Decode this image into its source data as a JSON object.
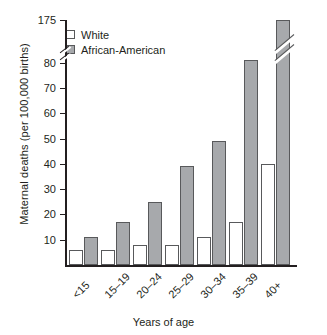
{
  "chart_data": {
    "type": "bar",
    "title": "",
    "xlabel": "Years of age",
    "ylabel": "Maternal deaths (per 100,000 births)",
    "categories": [
      "<15",
      "15–19",
      "20–24",
      "25–29",
      "30–34",
      "35–39",
      "40+"
    ],
    "series": [
      {
        "name": "White",
        "color": "#ffffff",
        "values": [
          6,
          6,
          8,
          8,
          11,
          17,
          40
        ]
      },
      {
        "name": "African-American",
        "color": "#a7a9ac",
        "values": [
          11,
          17,
          25,
          39,
          49,
          81,
          175
        ]
      }
    ],
    "ylim": [
      0,
      90
    ],
    "yticks": [
      10,
      20,
      30,
      40,
      50,
      60,
      70,
      80
    ],
    "ytick_labels": [
      "10",
      "20",
      "30",
      "40",
      "50",
      "60",
      "70",
      "80"
    ],
    "axis_break": {
      "present": true,
      "label_above_break": "175",
      "note": "y axis is broken between 80 and 175; the 40+ African-American bar (175) is drawn clipped with a break mark"
    },
    "grid": false,
    "legend_position": "top-left"
  },
  "legend": {
    "items": [
      {
        "label": "White",
        "swatch": "white-square-icon"
      },
      {
        "label": "African-American",
        "swatch": "gray-square-icon"
      }
    ]
  },
  "axis": {
    "top_label": "175",
    "y_title": "Maternal deaths (per 100,000 births)",
    "x_title": "Years of age"
  }
}
